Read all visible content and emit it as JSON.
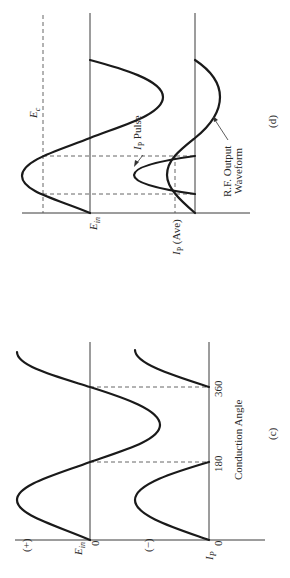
{
  "figure": {
    "orientation": "rotated 90 degrees counter-clockwise",
    "panels": [
      {
        "id": "d",
        "caption": "(d)",
        "labels": {
          "ec": "E",
          "ec_sub": "c",
          "ein": "E",
          "ein_sub": "in",
          "ip_ave_main": "I",
          "ip_ave_sub": "P",
          "ip_ave_rest": "(Ave)",
          "ip_pulse_main": "I",
          "ip_pulse_sub": "P",
          "ip_pulse_rest": "Pulse",
          "rf_line1": "R.F. Output",
          "rf_line2": "Waveform"
        }
      },
      {
        "id": "c",
        "caption": "(c)",
        "labels": {
          "plus": "(+)",
          "minus": "(−)",
          "ein": "E",
          "ein_sub": "in",
          "ip": "I",
          "ip_sub": "P",
          "zero1": "0",
          "zero2": "0",
          "tick180": "180",
          "tick360": "360",
          "xlabel": "Conduction Angle"
        }
      }
    ]
  }
}
